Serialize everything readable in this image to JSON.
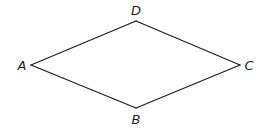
{
  "diagram": {
    "type": "quadrilateral",
    "shape": "rhombus",
    "stroke_color": "#231f20",
    "background": "#ffffff",
    "vertices": [
      {
        "name": "A",
        "x": 31,
        "y": 65,
        "label_x": 22,
        "label_y": 70
      },
      {
        "name": "B",
        "x": 136,
        "y": 108,
        "label_x": 136,
        "label_y": 124
      },
      {
        "name": "C",
        "x": 240,
        "y": 65,
        "label_x": 249,
        "label_y": 70
      },
      {
        "name": "D",
        "x": 136,
        "y": 21,
        "label_x": 136,
        "label_y": 15
      }
    ],
    "edges": [
      {
        "from": "A",
        "to": "D"
      },
      {
        "from": "D",
        "to": "C"
      },
      {
        "from": "C",
        "to": "B"
      },
      {
        "from": "B",
        "to": "A"
      }
    ],
    "labels": {
      "A": "A",
      "B": "B",
      "C": "C",
      "D": "D"
    }
  }
}
